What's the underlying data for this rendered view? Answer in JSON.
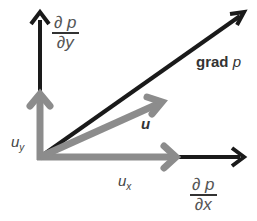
{
  "diagram": {
    "colors": {
      "gradient_arrows": "#1a1a1a",
      "velocity_arrows": "#8c8c8c",
      "background": "#ffffff"
    },
    "origin": [
      40,
      157
    ],
    "arrows": [
      {
        "id": "dp-dy",
        "from": [
          40,
          157
        ],
        "to": [
          40,
          12
        ],
        "color": "#1a1a1a",
        "width": 4
      },
      {
        "id": "dp-dx",
        "from": [
          40,
          157
        ],
        "to": [
          245,
          157
        ],
        "color": "#1a1a1a",
        "width": 4
      },
      {
        "id": "grad-p",
        "from": [
          40,
          157
        ],
        "to": [
          245,
          12
        ],
        "color": "#1a1a1a",
        "width": 4
      },
      {
        "id": "u",
        "from": [
          40,
          157
        ],
        "to": [
          165,
          100
        ],
        "color": "#8c8c8c",
        "width": 7
      },
      {
        "id": "u-x",
        "from": [
          40,
          157
        ],
        "to": [
          178,
          157
        ],
        "color": "#8c8c8c",
        "width": 7
      },
      {
        "id": "u-y",
        "from": [
          40,
          157
        ],
        "to": [
          40,
          92
        ],
        "color": "#8c8c8c",
        "width": 7
      }
    ],
    "labels": {
      "dp_dy": {
        "num": "∂ p",
        "den": "∂y"
      },
      "dp_dx": {
        "num": "∂ p",
        "den": "∂x"
      },
      "grad_p": {
        "word": "grad ",
        "var": "p"
      },
      "u": "u",
      "u_x": {
        "base": "u",
        "sub": "x"
      },
      "u_y": {
        "base": "u",
        "sub": "y"
      }
    }
  }
}
